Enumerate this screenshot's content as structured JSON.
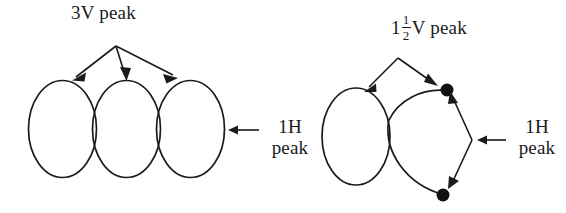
{
  "figure": {
    "title": "",
    "background_color": "#ffffff",
    "stroke_color": "#1a1a1a",
    "diagrams": [
      {
        "name": "three-loop-diagram",
        "description": "Three tangent vertical ellipses in a row",
        "loop_count": 3,
        "labels": {
          "top": "3V peak",
          "right_line1": "1H",
          "right_line2": "peak"
        }
      },
      {
        "name": "two-loop-diagram",
        "description": "One vertical ellipse tangent to a lens shape with two node dots",
        "loop_count": 2,
        "node_dot_count": 2,
        "labels": {
          "top_prefix": "1",
          "top_fraction_numerator": "1",
          "top_fraction_denominator": "2",
          "top_suffix": "V peak",
          "right_line1": "1H",
          "right_line2": "peak"
        }
      }
    ]
  },
  "labels": {
    "three_v_peak": "3V peak",
    "one_half_prefix": "1",
    "one_half_num": "1",
    "one_half_den": "2",
    "one_half_suffix": "V peak",
    "one_h": "1H",
    "peak": "peak"
  }
}
